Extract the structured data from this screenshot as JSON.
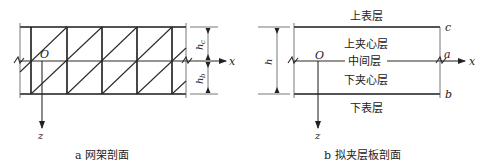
{
  "panel_a": {
    "caption": "a 网架剖面",
    "origin_label": "O",
    "x_axis_label": "x",
    "z_axis_label": "z",
    "dim_upper_label": "h",
    "dim_upper_sub": "c",
    "dim_lower_label": "h",
    "dim_lower_sub": "b"
  },
  "panel_b": {
    "caption": "b 拟夹层板剖面",
    "origin_label": "O",
    "x_axis_label": "x",
    "z_axis_label": "z",
    "dim_label": "h",
    "layers": {
      "top_surface": "上表层",
      "upper_core": "上夹心层",
      "middle": "中间层",
      "lower_core": "下夹心层",
      "bottom_surface": "下表层"
    },
    "point_labels": {
      "c": "c",
      "a": "a",
      "b": "b"
    }
  }
}
